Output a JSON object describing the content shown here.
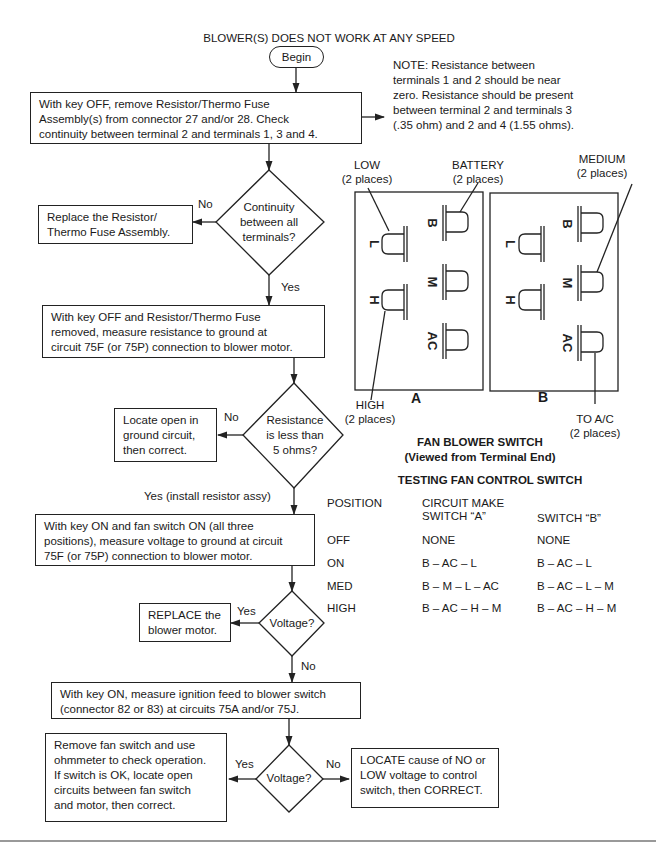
{
  "title": "BLOWER(S) DOES NOT WORK AT ANY SPEED",
  "start": "Begin",
  "note": {
    "lines": [
      "NOTE: Resistance between",
      "terminals 1 and 2 should be near",
      "zero. Resistance should be present",
      "between terminal 2 and terminals 3",
      "(.35 ohm) and 2 and 4 (1.55 ohms)."
    ]
  },
  "steps": {
    "step1": [
      "With key OFF, remove Resistor/Thermo Fuse",
      "Assembly(s) from connector 27 and/or 28. Check",
      "continuity between terminal 2 and terminals 1, 3 and 4."
    ],
    "decision1": [
      "Continuity",
      "between all",
      "terminals?"
    ],
    "decision1_no": "No",
    "decision1_yes": "Yes",
    "action1": [
      "Replace the Resistor/",
      "Thermo Fuse Assembly."
    ],
    "step2": [
      "With key OFF and Resistor/Thermo Fuse",
      "removed, measure resistance to ground at",
      "circuit 75F (or 75P) connection to blower motor."
    ],
    "decision2": [
      "Resistance",
      "is less than",
      "5 ohms?"
    ],
    "decision2_no": "No",
    "decision2_yes": "Yes (install resistor assy)",
    "action2": [
      "Locate open in",
      "ground circuit,",
      "then correct."
    ],
    "step3": [
      "With key ON and fan switch ON (all three",
      "positions), measure voltage to ground at circuit",
      "75F (or 75P) connection to blower motor."
    ],
    "decision3": [
      "Voltage?"
    ],
    "decision3_yes": "Yes",
    "decision3_no": "No",
    "action3": [
      "REPLACE the",
      "blower motor."
    ],
    "step4": [
      "With key ON, measure ignition feed to blower switch",
      "(connector 82 or 83) at circuits 75A and/or 75J."
    ],
    "decision4": [
      "Voltage?"
    ],
    "decision4_yes": "Yes",
    "decision4_no": "No",
    "action4_yes": [
      "Remove fan switch and use",
      "ohmmeter to check operation.",
      "If switch is OK, locate open",
      "circuits between fan switch",
      "and motor, then correct."
    ],
    "action4_no": [
      "LOCATE cause of NO or",
      "LOW voltage to control",
      "switch, then CORRECT."
    ]
  },
  "switch_diagram": {
    "labels": {
      "low": [
        "LOW",
        "(2 places)"
      ],
      "battery": [
        "BATTERY",
        "(2 places)"
      ],
      "medium": [
        "MEDIUM",
        "(2 places)"
      ],
      "high": [
        "HIGH",
        "(2 places)"
      ],
      "to_ac": [
        "TO A/C",
        "(2 places)"
      ]
    },
    "terminals": {
      "b": "B",
      "l": "L",
      "m": "M",
      "h": "H",
      "ac": "AC"
    },
    "switch_a": "A",
    "switch_b": "B",
    "caption": [
      "FAN BLOWER SWITCH",
      "(Viewed from Terminal End)"
    ]
  },
  "test_table": {
    "title": "TESTING FAN CONTROL SWITCH",
    "headers": {
      "position": "POSITION",
      "switch_a_line1": "CIRCUIT MAKE",
      "switch_a_line2": "SWITCH “A”",
      "switch_b": "SWITCH “B”"
    },
    "rows": [
      {
        "position": "OFF",
        "a": "NONE",
        "b": "NONE"
      },
      {
        "position": "ON",
        "a": "B – AC – L",
        "b": "B – AC – L"
      },
      {
        "position": "MED",
        "a": "B – M – L – AC",
        "b": "B – AC – L – M"
      },
      {
        "position": "HIGH",
        "a": "B – AC – H – M",
        "b": "B – AC – H – M"
      }
    ]
  }
}
